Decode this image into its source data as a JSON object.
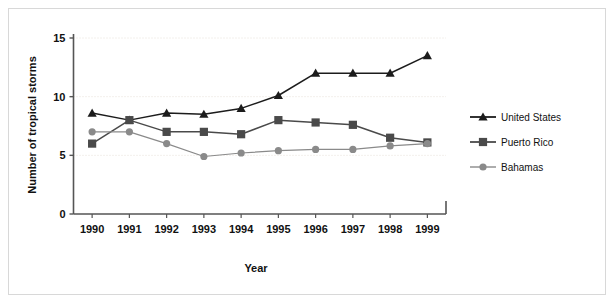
{
  "chart_data": {
    "type": "line",
    "title": "",
    "xlabel": "Year",
    "ylabel": "Number of tropical storms",
    "categories": [
      "1990",
      "1991",
      "1992",
      "1993",
      "1994",
      "1995",
      "1996",
      "1997",
      "1998",
      "1999"
    ],
    "x": [
      1990,
      1991,
      1992,
      1993,
      1994,
      1995,
      1996,
      1997,
      1998,
      1999
    ],
    "xlim": [
      1989.6,
      1999.6
    ],
    "ylim": [
      0,
      15
    ],
    "yticks": [
      0,
      5,
      10,
      15
    ],
    "ytick_labels": [
      "0",
      "5",
      "10",
      "15"
    ],
    "grid": "horizontal-dotted",
    "legend_position": "right",
    "series": [
      {
        "name": "United States",
        "marker": "triangle",
        "color": "#1c1c1c",
        "values": [
          8.6,
          8.0,
          8.6,
          8.5,
          9.0,
          10.1,
          12.0,
          12.0,
          12.0,
          13.5
        ]
      },
      {
        "name": "Puerto Rico",
        "marker": "square",
        "color": "#4a4a4a",
        "values": [
          6.0,
          8.0,
          7.0,
          7.0,
          6.8,
          8.0,
          7.8,
          7.6,
          6.5,
          6.1
        ]
      },
      {
        "name": "Bahamas",
        "marker": "circle",
        "color": "#8a8a8a",
        "values": [
          7.0,
          7.0,
          6.0,
          4.9,
          5.2,
          5.4,
          5.5,
          5.5,
          5.8,
          6.0
        ]
      }
    ]
  },
  "figure": {
    "background_color": "#ffffff",
    "frame_color": "#d8d8d8",
    "axis_color": "#555555",
    "grid_color": "#e6e0d8"
  },
  "legend": {
    "items": [
      {
        "label": "United States"
      },
      {
        "label": "Puerto Rico"
      },
      {
        "label": "Bahamas"
      }
    ]
  }
}
